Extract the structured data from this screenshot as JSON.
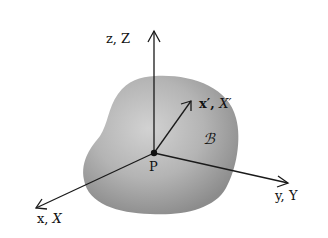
{
  "diagram": {
    "type": "3d-coordinate-axes-with-rigid-body",
    "labels": {
      "z_axis": "z, Z",
      "x_axis_low": "x,",
      "x_axis_cap": "X",
      "y_axis": "y, Y",
      "x_prime_low": "x′,",
      "x_prime_cap": "X′",
      "body": "ℬ",
      "point": "P"
    },
    "colors": {
      "axis": "#1a1a1a",
      "body_fill_center": "#c8c8c8",
      "body_fill_edge": "#8a8a8a",
      "background": "#ffffff"
    },
    "geometry": {
      "origin": [
        154,
        153
      ],
      "z_axis_end": [
        154,
        30
      ],
      "x_axis_end": [
        36,
        208
      ],
      "y_axis_end": [
        288,
        183
      ],
      "x_prime_end": [
        191,
        101
      ]
    }
  }
}
